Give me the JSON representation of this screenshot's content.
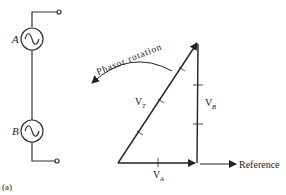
{
  "figure_label": "(a)",
  "circuit": {
    "source_a_label": "A",
    "source_b_label": "B"
  },
  "phasor_diagram": {
    "rotation_label": "Phasor rotation",
    "reference_label": "Reference",
    "vectors": [
      {
        "name": "V",
        "subscript": "A",
        "description": "horizontal phasor along reference"
      },
      {
        "name": "V",
        "subscript": "B",
        "description": "vertical phasor, 90 degrees leading"
      },
      {
        "name": "V",
        "subscript": "T",
        "description": "resultant phasor sum"
      }
    ]
  },
  "colors": {
    "line": "#222222",
    "background": "#ffffff"
  }
}
